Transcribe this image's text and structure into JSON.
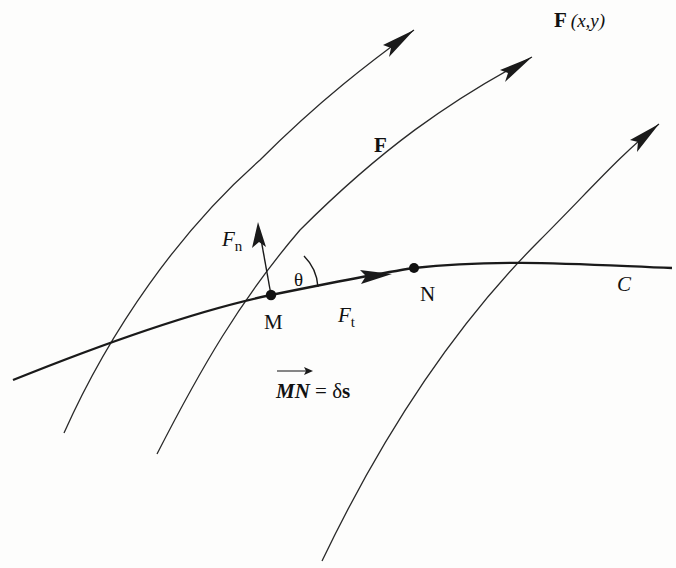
{
  "figure": {
    "labels": {
      "field_title_bold": "F",
      "field_title_args": "(x,y)",
      "field": "F",
      "normal_component_base": "F",
      "normal_component_sub": "n",
      "tangential_component_base": "F",
      "tangential_component_sub": "t",
      "angle": "θ",
      "point_m": "M",
      "point_n": "N",
      "curve": "C",
      "displacement_lhs": "MN",
      "displacement_eq": " = δ",
      "displacement_rhs": "s"
    },
    "points": {
      "M": {
        "x": 271,
        "y": 295
      },
      "N": {
        "x": 414,
        "y": 268
      }
    },
    "field_lines": [
      {
        "id": "field-line-1",
        "tail": [
          64,
          433
        ],
        "tip": [
          414,
          30
        ]
      },
      {
        "id": "field-line-2",
        "tail": [
          157,
          454
        ],
        "tip": [
          532,
          57
        ]
      },
      {
        "id": "field-line-3",
        "tail": [
          322,
          561
        ],
        "tip": [
          659,
          124
        ]
      }
    ],
    "curve_c": {
      "start": [
        13,
        380
      ],
      "end": [
        672,
        268
      ]
    },
    "colors": {
      "ink": "#1a1a1a",
      "paper": "#fdfdfc"
    }
  }
}
